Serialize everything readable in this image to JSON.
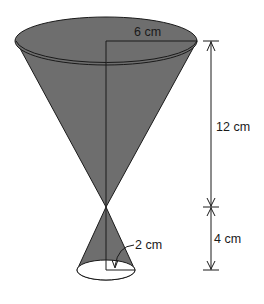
{
  "figure": {
    "type": "compound cone diagram (inverted cone atop smaller cone)",
    "fill_color": "#6e6e6e",
    "line_color": "#1a1a1a",
    "labels": {
      "top_radius": "6 cm",
      "top_height": "12 cm",
      "bottom_height": "4 cm",
      "bottom_radius": "2 cm"
    }
  }
}
